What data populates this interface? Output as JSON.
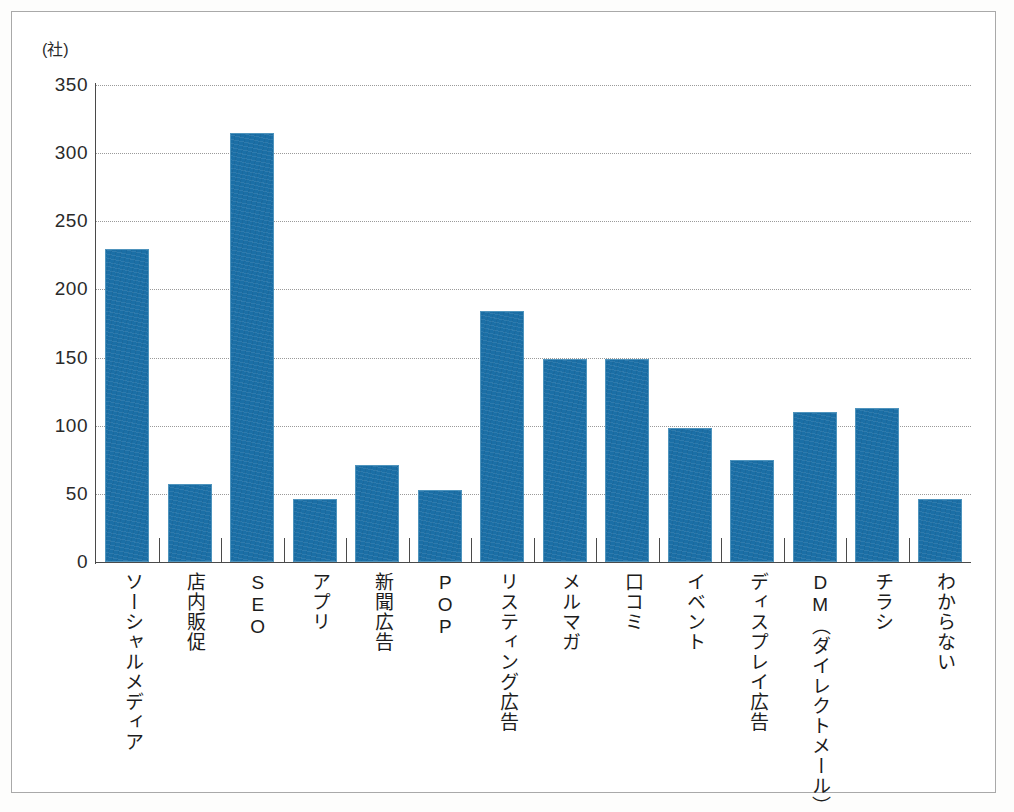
{
  "chart_data": {
    "type": "bar",
    "title": "",
    "xlabel": "",
    "ylabel": "(社)",
    "ylim": [
      0,
      350
    ],
    "ytick_step": 50,
    "yticks": [
      350,
      300,
      250,
      200,
      150,
      100,
      50,
      0
    ],
    "grid": true,
    "legend": "none",
    "categories": [
      "ソーシャルメディア",
      "店内販促",
      "SEO",
      "アプリ",
      "新聞広告",
      "POP",
      "リスティング広告",
      "メルマガ",
      "口コミ",
      "イベント",
      "ディスプレイ広告",
      "DM（ダイレクトメール）",
      "チラシ",
      "わからない"
    ],
    "values": [
      230,
      57,
      315,
      46,
      71,
      53,
      184,
      149,
      149,
      98,
      75,
      110,
      113,
      46
    ],
    "series": [
      {
        "name": "回答数",
        "values": [
          230,
          57,
          315,
          46,
          71,
          53,
          184,
          149,
          149,
          98,
          75,
          110,
          113,
          46
        ]
      }
    ],
    "bar_color": "#1b6fa6",
    "bar_edge_color": "#4f94bd",
    "gridline_color": "#9a9a9a",
    "axis_color": "#4a4a4a"
  },
  "axis": {
    "unit_label": "(社)",
    "y_tick_labels": [
      "350",
      "300",
      "250",
      "200",
      "150",
      "100",
      "50",
      "0"
    ]
  }
}
